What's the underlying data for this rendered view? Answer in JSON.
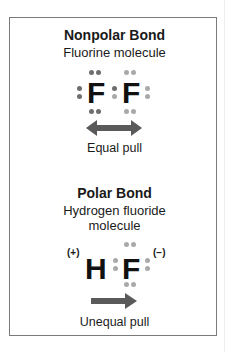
{
  "nonpolar": {
    "title": "Nonpolar Bond",
    "subtitle": "Fluorine molecule",
    "atom_left": "F",
    "atom_right": "F",
    "arrow": "double-headed-arrow",
    "caption": "Equal pull"
  },
  "polar": {
    "title": "Polar Bond",
    "subtitle_line1": "Hydrogen fluoride",
    "subtitle_line2": "molecule",
    "atom_left": "H",
    "atom_right": "F",
    "charge_left": "(+)",
    "charge_right": "(−)",
    "arrow": "right-arrow",
    "caption": "Unequal pull"
  },
  "colors": {
    "border": "#7a7a7a",
    "electron_dark": "#6e6e6e",
    "electron_light": "#a9a9a9",
    "arrow": "#5a5a5a"
  }
}
